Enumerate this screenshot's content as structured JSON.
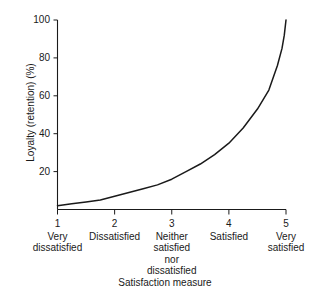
{
  "chart_data": {
    "type": "line",
    "title": "",
    "xlabel": "Satisfaction measure",
    "ylabel": "Loyalty (retention) (%)",
    "xlim": [
      1,
      5
    ],
    "ylim": [
      0,
      100
    ],
    "grid": false,
    "legend": "none",
    "line_color": "#1a1a1a",
    "x_ticks": [
      "1",
      "2",
      "3",
      "4",
      "5"
    ],
    "x_tick_values": [
      1,
      2,
      3,
      4,
      5
    ],
    "x_categories": [
      "Very\ndissatisfied",
      "Dissatisfied",
      "Neither\nsatisfied\nnor\ndissatisfied",
      "Satisfied",
      "Very\nsatisfied"
    ],
    "y_ticks": [
      "20",
      "40",
      "60",
      "80",
      "100"
    ],
    "y_tick_values": [
      20,
      40,
      60,
      80,
      100
    ],
    "series": [
      {
        "name": "Loyalty curve",
        "x": [
          1.0,
          1.25,
          1.5,
          1.75,
          2.0,
          2.25,
          2.5,
          2.75,
          3.0,
          3.25,
          3.5,
          3.75,
          4.0,
          4.25,
          4.5,
          4.7,
          4.85,
          4.93,
          4.97,
          5.0
        ],
        "values": [
          2,
          3,
          4,
          5,
          7,
          9,
          11,
          13,
          16,
          20,
          24,
          29,
          35,
          43,
          53,
          63,
          76,
          85,
          92,
          100
        ]
      }
    ]
  },
  "axis_labels": {
    "y_title": "Loyalty (retention) (%)",
    "x_title": "Satisfaction measure"
  },
  "x_category_lines": [
    [
      "Very",
      "dissatisfied"
    ],
    [
      "Dissatisfied"
    ],
    [
      "Neither",
      "satisfied",
      "nor",
      "dissatisfied"
    ],
    [
      "Satisfied"
    ],
    [
      "Very",
      "satisfied"
    ]
  ]
}
